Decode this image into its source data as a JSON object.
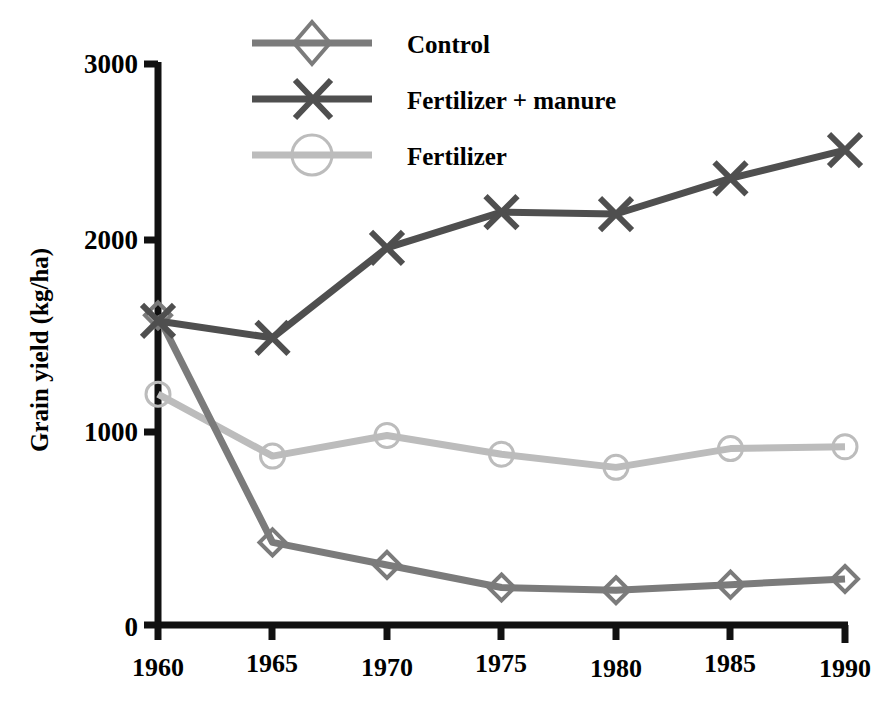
{
  "chart_data": {
    "type": "line",
    "title": "",
    "xlabel": "",
    "ylabel": "Grain yield (kg/ha)",
    "x": [
      1960,
      1965,
      1970,
      1975,
      1980,
      1985,
      1990
    ],
    "xtick_labels": [
      "1960",
      "1965",
      "1970",
      "1975",
      "1980",
      "1985",
      "1990"
    ],
    "ytick_labels": [
      "0",
      "1000",
      "2000",
      "3000"
    ],
    "yticks": [
      0,
      1000,
      2000,
      3000
    ],
    "xlim": [
      1960,
      1990
    ],
    "ylim": [
      0,
      3000
    ],
    "grid": false,
    "legend_position": "top-center",
    "series": [
      {
        "name": "Control",
        "marker": "diamond",
        "color": "#7b7b7b",
        "values": [
          1650,
          440,
          320,
          200,
          185,
          215,
          245
        ]
      },
      {
        "name": "Fertilizer + manure",
        "marker": "x",
        "color": "#4f4f4f",
        "values": [
          1620,
          1530,
          2010,
          2200,
          2190,
          2380,
          2530
        ]
      },
      {
        "name": "Fertilizer",
        "marker": "circle",
        "color": "#bcbcbc",
        "values": [
          1230,
          900,
          1010,
          910,
          840,
          940,
          950
        ]
      }
    ]
  },
  "legend": {
    "items": [
      {
        "label": "Control"
      },
      {
        "label": "Fertilizer + manure"
      },
      {
        "label": "Fertilizer"
      }
    ]
  },
  "axes": {
    "y_title": "Grain yield (kg/ha)",
    "y_labels": [
      "3000",
      "2000",
      "1000",
      "0"
    ],
    "x_labels": [
      "1960",
      "1965",
      "1970",
      "1975",
      "1980",
      "1985",
      "1990"
    ],
    "axis_color": "#111111"
  }
}
